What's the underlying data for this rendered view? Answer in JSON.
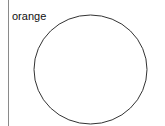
{
  "diagram": {
    "label": "orange",
    "shape": {
      "type": "circle",
      "cx": 90.5,
      "cy": 69.5,
      "rx": 56.5,
      "ry": 54.5,
      "stroke": "#333333",
      "fill": "#ffffff"
    },
    "divider": {
      "color": "#8a8a8a"
    }
  }
}
